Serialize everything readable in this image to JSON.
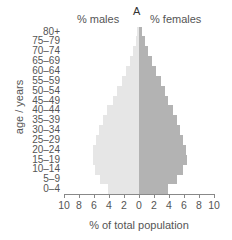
{
  "chart_data": {
    "type": "bar",
    "subtype": "population-pyramid",
    "panel_label": "A",
    "title": "",
    "left_title": "% males",
    "right_title": "% females",
    "xlabel": "% of total population",
    "ylabel": "age / years",
    "xlim": [
      -10,
      10
    ],
    "x_ticks": [
      "10",
      "8",
      "6",
      "4",
      "2",
      "0",
      "2",
      "4",
      "6",
      "8",
      "10"
    ],
    "grid": false,
    "legend": null,
    "categories": [
      "0–4",
      "5–9",
      "10–14",
      "15–19",
      "20–24",
      "25–29",
      "30–34",
      "35–39",
      "40–44",
      "45–49",
      "50–54",
      "55–59",
      "60–64",
      "65–69",
      "70–74",
      "75–79",
      "80+"
    ],
    "series": [
      {
        "name": "% males",
        "color": "#e6e6e6",
        "values": [
          4.1,
          5.2,
          5.9,
          6.1,
          6.1,
          5.7,
          5.4,
          4.8,
          4.3,
          3.5,
          2.9,
          2.3,
          1.7,
          1.2,
          0.8,
          0.4,
          0.3
        ]
      },
      {
        "name": "% females",
        "color": "#b3b3b3",
        "values": [
          3.9,
          5.0,
          5.9,
          6.4,
          6.3,
          5.9,
          5.5,
          5.0,
          4.5,
          3.9,
          3.4,
          2.9,
          2.3,
          1.7,
          1.2,
          0.8,
          0.4
        ]
      }
    ]
  }
}
